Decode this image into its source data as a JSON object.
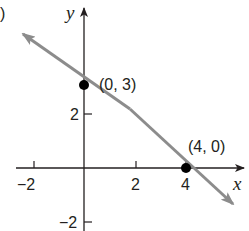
{
  "figure": {
    "part_label": ")",
    "axes": {
      "x_label": "x",
      "y_label": "y",
      "x_ticks": [
        {
          "value": -2,
          "label": "−2"
        },
        {
          "value": 2,
          "label": "2"
        },
        {
          "value": 4,
          "label": "4"
        }
      ],
      "y_ticks": [
        {
          "value": 2,
          "label": "2"
        },
        {
          "value": -2,
          "label": "−2"
        }
      ]
    },
    "points": [
      {
        "x": 0,
        "y": 3,
        "label": "(0, 3)"
      },
      {
        "x": 4,
        "y": 0,
        "label": "(4, 0)"
      }
    ],
    "line": {
      "description": "line through (0, 3) and (4, 0)",
      "color": "#8c8c8c"
    },
    "axis_color": "#231f20",
    "point_color": "#000000"
  }
}
